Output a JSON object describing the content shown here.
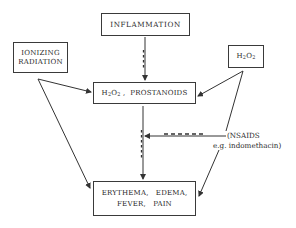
{
  "diagram": {
    "nodes": {
      "inflammation": {
        "label": "INFLAMMATION"
      },
      "ionizing_radiation": {
        "line1": "IONIZING",
        "line2": "RADIATION"
      },
      "h2o2_source": {
        "h": "H",
        "sub1": "2",
        "o": "O",
        "sub2": "2"
      },
      "mediators": {
        "h": "H",
        "sub1": "2",
        "o": "O",
        "sub2": "2",
        "rest": " ,  PROSTANOIDS"
      },
      "symptoms": {
        "line1": "ERYTHEMA,   EDEMA,",
        "line2": "FEVER,   PAIN"
      }
    },
    "inhibitor": {
      "line1": "(NSAIDS",
      "line2": "e.g. indomethacin)"
    },
    "edges": [
      {
        "from": "inflammation",
        "to": "mediators",
        "style": "solid-with-dashes"
      },
      {
        "from": "ionizing_radiation",
        "to": "mediators",
        "style": "solid"
      },
      {
        "from": "ionizing_radiation",
        "to": "symptoms",
        "style": "solid"
      },
      {
        "from": "h2o2_source",
        "to": "mediators",
        "style": "solid"
      },
      {
        "from": "h2o2_source",
        "to": "symptoms",
        "style": "solid"
      },
      {
        "from": "mediators",
        "to": "symptoms",
        "style": "solid-with-dashes"
      },
      {
        "from": "inhibitor",
        "to": "mediators-symptoms-path",
        "style": "inhibition-dashed"
      }
    ]
  }
}
